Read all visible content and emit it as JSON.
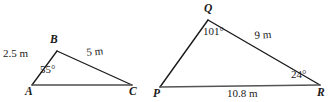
{
  "figure": {
    "stroke_color": "#1a1a1a",
    "text_color": "#1a1a1a",
    "background_color": "#ffffff",
    "triangles": [
      {
        "name": "triangle-abc",
        "vertices": [
          {
            "label": "A",
            "x": 32,
            "y": 85
          },
          {
            "label": "B",
            "x": 57,
            "y": 51
          },
          {
            "label": "C",
            "x": 132,
            "y": 85
          }
        ],
        "side_labels": [
          {
            "name": "side-ab",
            "text": "2.5 m"
          },
          {
            "name": "side-bc",
            "text": "5 m"
          }
        ],
        "angle_labels": [
          {
            "name": "angle-a",
            "text": "55°"
          }
        ]
      },
      {
        "name": "triangle-pqr",
        "vertices": [
          {
            "label": "P",
            "x": 160,
            "y": 87
          },
          {
            "label": "Q",
            "x": 208,
            "y": 20
          },
          {
            "label": "R",
            "x": 320,
            "y": 85
          }
        ],
        "side_labels": [
          {
            "name": "side-qr",
            "text": "9 m"
          },
          {
            "name": "side-pr",
            "text": "10.8 m"
          }
        ],
        "angle_labels": [
          {
            "name": "angle-q",
            "text": "101°"
          },
          {
            "name": "angle-r",
            "text": "24°"
          }
        ]
      }
    ],
    "labels": {
      "vertex_a": "A",
      "vertex_b": "B",
      "vertex_c": "C",
      "vertex_p": "P",
      "vertex_q": "Q",
      "vertex_r": "R",
      "side_ab": "2.5 m",
      "side_bc": "5 m",
      "angle_a": "55°",
      "angle_q": "101°",
      "angle_r": "24°",
      "side_qr": "9 m",
      "side_pr": "10.8 m"
    }
  }
}
